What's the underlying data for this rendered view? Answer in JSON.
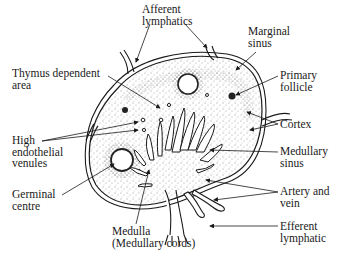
{
  "diagram": {
    "labels": {
      "afferent": {
        "line1": "Afferent",
        "line2": "lymphatics"
      },
      "marginal": {
        "line1": "Marginal",
        "line2": "sinus"
      },
      "thymus": {
        "line1": "Thymus dependent",
        "line2": "area"
      },
      "primary": {
        "line1": "Primary",
        "line2": "follicle"
      },
      "cortex": {
        "line1": "Cortex"
      },
      "hev": {
        "line1": "High",
        "line2": "endothelial",
        "line3": "venules"
      },
      "medsinus": {
        "line1": "Medullary",
        "line2": "sinus"
      },
      "germinal": {
        "line1": "Germinal",
        "line2": "centre"
      },
      "artery": {
        "line1": "Artery and",
        "line2": "vein"
      },
      "medulla": {
        "line1": "Medulla",
        "line2": "(Medullary cords)"
      },
      "efferent": {
        "line1": "Efferent",
        "line2": "lymphatic"
      }
    },
    "colors": {
      "ink": "#1a1a1a",
      "background": "#ffffff"
    }
  }
}
